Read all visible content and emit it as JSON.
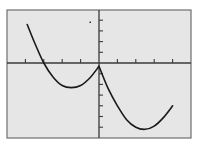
{
  "chart_data": {
    "type": "line",
    "title": "",
    "xlabel": "",
    "ylabel": "",
    "xlim": [
      -5,
      5
    ],
    "ylim": [
      -7,
      5
    ],
    "x_ticks": [
      -4,
      -3,
      -2,
      -1,
      1,
      2,
      3,
      4
    ],
    "y_ticks": [
      -6,
      -5,
      -4,
      -3,
      -2,
      -1,
      1,
      2,
      3,
      4
    ],
    "grid": false,
    "legend": null,
    "series": [
      {
        "name": "curve",
        "x": [
          -3.9,
          -3.5,
          -3.0,
          -2.5,
          -2.0,
          -1.5,
          -1.0,
          -0.5,
          0.0,
          0.5,
          1.0,
          1.5,
          2.0,
          2.5,
          3.0,
          3.5,
          4.0
        ],
        "y": [
          3.6,
          1.9,
          0.0,
          -1.3,
          -2.1,
          -2.3,
          -2.1,
          -1.4,
          -0.3,
          -2.4,
          -4.0,
          -5.3,
          -6.0,
          -6.2,
          -5.9,
          -5.1,
          -4.0
        ]
      }
    ],
    "annotations": []
  },
  "colors": {
    "plot_bg": "#e6e6e6",
    "frame": "#6f6f6f",
    "axis": "#3a3a3a",
    "curve": "#1a1a1a"
  }
}
